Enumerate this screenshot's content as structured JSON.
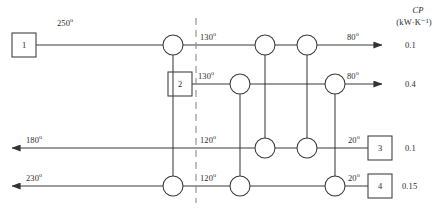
{
  "figure": {
    "kind": "heat-exchanger-network-grid-diagram",
    "pinch_line": {
      "x": 196,
      "style": "dashed",
      "color": "#8a8a8a"
    }
  },
  "column_header": {
    "symbol": "CP",
    "units": "(kW·K⁻¹)"
  },
  "streams": [
    {
      "id": "stream-1",
      "box_label": "1",
      "box_side": "left",
      "direction": "right",
      "inlet_temp": "250",
      "pinch_temp": "130",
      "outlet_temp": "80",
      "cp": "0.1"
    },
    {
      "id": "stream-2",
      "box_label": "2",
      "box_side": "middle-left",
      "direction": "right",
      "inlet_temp": "",
      "pinch_temp": "130",
      "outlet_temp": "80",
      "cp": "0.4"
    },
    {
      "id": "stream-3",
      "box_label": "3",
      "box_side": "right",
      "direction": "left",
      "outlet_temp": "180",
      "pinch_temp": "120",
      "inlet_temp": "20",
      "cp": "0.1"
    },
    {
      "id": "stream-4",
      "box_label": "4",
      "box_side": "right",
      "direction": "left",
      "outlet_temp": "230",
      "pinch_temp": "120",
      "inlet_temp": "20",
      "cp": "0.15"
    }
  ],
  "temperature_labels": {
    "s1_inlet": "250",
    "s1_pinch": "130",
    "s1_outlet": "80",
    "s2_pinch": "130",
    "s2_outlet": "80",
    "s3_outlet": "180",
    "s3_pinch": "120",
    "s3_inlet": "20",
    "s4_outlet": "230",
    "s4_pinch": "120",
    "s4_inlet": "20"
  },
  "cp_values": {
    "s1": "0.1",
    "s2": "0.4",
    "s3": "0.1",
    "s4": "0.15"
  },
  "degree_symbol": "°",
  "exchangers": [
    {
      "name": "exchanger-a-hot",
      "cx": 173,
      "cy": 45,
      "r": 10
    },
    {
      "name": "exchanger-a-cold",
      "cx": 173,
      "cy": 186,
      "r": 10
    },
    {
      "name": "exchanger-b-hot",
      "cx": 240,
      "cy": 84,
      "r": 10
    },
    {
      "name": "exchanger-b-cold",
      "cx": 240,
      "cy": 186,
      "r": 10
    },
    {
      "name": "exchanger-c-hot",
      "cx": 265,
      "cy": 45,
      "r": 10
    },
    {
      "name": "exchanger-c-cold",
      "cx": 265,
      "cy": 148,
      "r": 10
    },
    {
      "name": "exchanger-d-hot",
      "cx": 307,
      "cy": 45,
      "r": 10
    },
    {
      "name": "exchanger-d-cold",
      "cx": 307,
      "cy": 148,
      "r": 10
    },
    {
      "name": "exchanger-e-hot",
      "cx": 335,
      "cy": 84,
      "r": 10
    },
    {
      "name": "exchanger-e-cold",
      "cx": 335,
      "cy": 186,
      "r": 10
    }
  ]
}
